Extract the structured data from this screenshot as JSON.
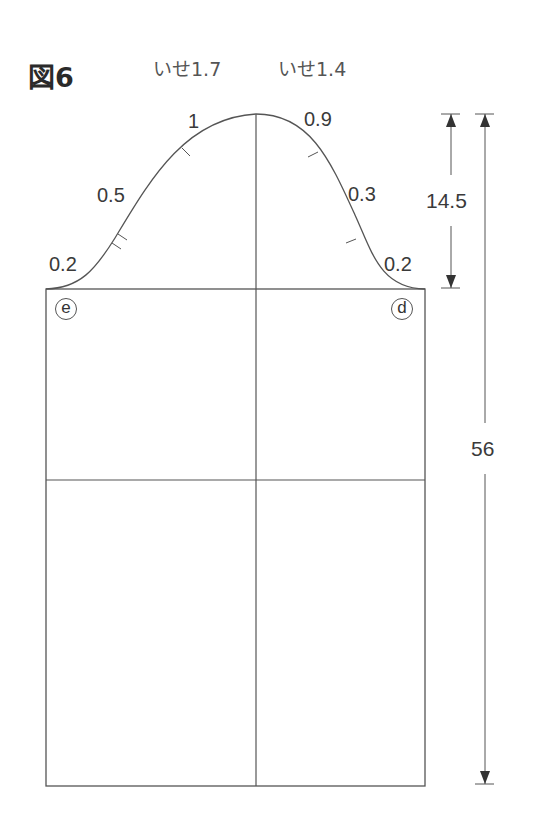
{
  "figure": {
    "title": "図6",
    "ease_left": "いせ1.7",
    "ease_right": "いせ1.4"
  },
  "curve_labels": {
    "left_top": "1",
    "left_mid": "0.5",
    "left_low": "0.2",
    "right_top": "0.9",
    "right_mid": "0.3",
    "right_low": "0.2"
  },
  "markers": {
    "left_corner": "e",
    "right_corner": "d"
  },
  "dimensions": {
    "cap_height": "14.5",
    "total_length": "56"
  }
}
